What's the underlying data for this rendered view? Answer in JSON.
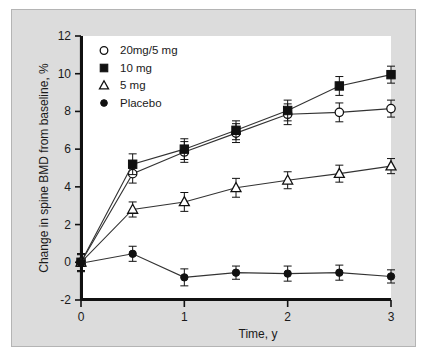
{
  "chart_data": {
    "type": "line",
    "title": "",
    "xlabel": "Time, y",
    "ylabel": "Change in spine BMD from baseline, %",
    "xlim": [
      0,
      3
    ],
    "ylim": [
      -2,
      12
    ],
    "xticks": [
      0,
      1,
      2,
      3
    ],
    "xtick_labels": [
      "0",
      "1",
      "2",
      "3"
    ],
    "yticks": [
      -2,
      0,
      2,
      4,
      6,
      8,
      10,
      12
    ],
    "ytick_labels": [
      "-2",
      "0",
      "2",
      "4",
      "6",
      "8",
      "10",
      "12"
    ],
    "grid": false,
    "legend_position": "upper-left",
    "x": [
      0,
      0.5,
      1,
      1.5,
      2,
      2.5,
      3
    ],
    "series": [
      {
        "name": "20mg/5 mg",
        "marker": "open-circle",
        "values": [
          0.0,
          4.7,
          5.85,
          6.85,
          7.85,
          7.95,
          8.15
        ],
        "errors": [
          0.45,
          0.5,
          0.55,
          0.5,
          0.55,
          0.5,
          0.45
        ]
      },
      {
        "name": "10 mg",
        "marker": "filled-square",
        "values": [
          0.0,
          5.2,
          6.0,
          7.0,
          8.05,
          9.35,
          9.95
        ],
        "errors": [
          0.45,
          0.55,
          0.55,
          0.5,
          0.55,
          0.5,
          0.45
        ]
      },
      {
        "name": "5 mg",
        "marker": "open-triangle",
        "values": [
          0.0,
          2.8,
          3.2,
          3.95,
          4.35,
          4.7,
          5.1
        ],
        "errors": [
          0.45,
          0.4,
          0.5,
          0.5,
          0.45,
          0.45,
          0.4
        ]
      },
      {
        "name": "Placebo",
        "marker": "filled-circle",
        "values": [
          -0.05,
          0.45,
          -0.8,
          -0.55,
          -0.6,
          -0.55,
          -0.75
        ],
        "errors": [
          0.45,
          0.4,
          0.45,
          0.35,
          0.4,
          0.4,
          0.35
        ]
      }
    ]
  },
  "legend": {
    "entries": [
      {
        "label": "20mg/5 mg",
        "marker": "open-circle"
      },
      {
        "label": "10 mg",
        "marker": "filled-square"
      },
      {
        "label": "5 mg",
        "marker": "open-triangle"
      },
      {
        "label": "Placebo",
        "marker": "filled-circle"
      }
    ]
  },
  "colors": {
    "ink": "#111111",
    "plot_background": "#ffffff",
    "figure_background": "#dcdcdc",
    "frame_border": "#b4b4b4",
    "line": "#333333"
  }
}
